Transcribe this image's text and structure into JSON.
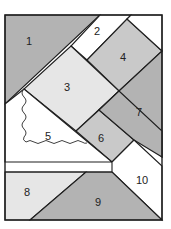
{
  "diagram": {
    "type": "quilt-block-pattern",
    "colors": {
      "dark": "#b3b3b3",
      "medium": "#c9c9c9",
      "light": "#e6e6e6",
      "white": "#ffffff",
      "line": "#1e1e1e"
    },
    "pieces": [
      {
        "id": 1,
        "label": "1",
        "shade": "dark"
      },
      {
        "id": 2,
        "label": "2",
        "shade": "white"
      },
      {
        "id": 3,
        "label": "3",
        "shade": "light"
      },
      {
        "id": 4,
        "label": "4",
        "shade": "medium"
      },
      {
        "id": 5,
        "label": "5",
        "shade": "white"
      },
      {
        "id": 6,
        "label": "6",
        "shade": "medium"
      },
      {
        "id": 7,
        "label": "7",
        "shade": "dark"
      },
      {
        "id": 8,
        "label": "8",
        "shade": "light"
      },
      {
        "id": 9,
        "label": "9",
        "shade": "dark"
      },
      {
        "id": 10,
        "label": "10",
        "shade": "white"
      }
    ]
  }
}
